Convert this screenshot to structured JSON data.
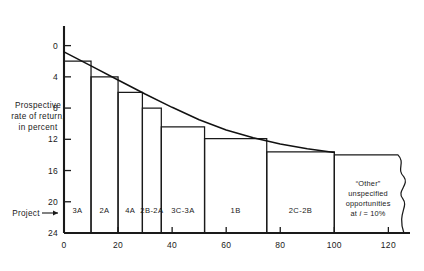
{
  "axes": {
    "y_title_lines": [
      "Prospective",
      "rate of return,",
      "in percent"
    ],
    "y_ticks": [
      "24",
      "20",
      "16",
      "12",
      "8",
      "4",
      "0"
    ],
    "x_ticks": [
      "0",
      "20",
      "40",
      "60",
      "80",
      "100",
      "120"
    ],
    "project_label": "Project",
    "project_arrow": "→"
  },
  "other_block": {
    "line1": "“Other”",
    "line2": "unspecified",
    "line3": "opportunities",
    "line4_prefix": "at ",
    "line4_symbol": "i",
    "line4_suffix": " = 10%"
  },
  "colors": {
    "ink": "#1a1a1a",
    "background": "#ffffff",
    "curve": "#111111"
  },
  "chart_data": {
    "type": "bar",
    "title": "",
    "xlabel": "",
    "ylabel": "Prospective rate of return, in percent",
    "xlim": [
      0,
      128
    ],
    "ylim": [
      0,
      26
    ],
    "x_ticks": [
      0,
      20,
      40,
      60,
      80,
      100,
      120
    ],
    "y_ticks": [
      0,
      4,
      8,
      12,
      16,
      20,
      24
    ],
    "grid": false,
    "legend": "none",
    "bars": [
      {
        "label": "3A",
        "x_start": 0,
        "x_end": 10,
        "value": 22.0
      },
      {
        "label": "2A",
        "x_start": 10,
        "x_end": 20,
        "value": 20.0
      },
      {
        "label": "4A",
        "x_start": 20,
        "x_end": 29,
        "value": 18.0
      },
      {
        "label": "2B-2A",
        "x_start": 29,
        "x_end": 36,
        "value": 16.0
      },
      {
        "label": "3C-3A",
        "x_start": 36,
        "x_end": 52,
        "value": 13.6
      },
      {
        "label": "1B",
        "x_start": 52,
        "x_end": 75,
        "value": 12.1
      },
      {
        "label": "2C-2B",
        "x_start": 75,
        "x_end": 100,
        "value": 10.4
      },
      {
        "label": "“Other” unspecified opportunities at i = 10%",
        "x_start": 100,
        "x_end": 125,
        "value": 10.0
      }
    ],
    "curve_note": "smooth declining investment-opportunity curve fitted through the bar tops",
    "curve_points": [
      {
        "x": 0,
        "y": 23.2
      },
      {
        "x": 10,
        "y": 21.4
      },
      {
        "x": 20,
        "y": 19.6
      },
      {
        "x": 30,
        "y": 17.8
      },
      {
        "x": 40,
        "y": 16.1
      },
      {
        "x": 50,
        "y": 14.5
      },
      {
        "x": 60,
        "y": 13.2
      },
      {
        "x": 70,
        "y": 12.2
      },
      {
        "x": 80,
        "y": 11.4
      },
      {
        "x": 90,
        "y": 10.8
      },
      {
        "x": 100,
        "y": 10.3
      }
    ]
  }
}
